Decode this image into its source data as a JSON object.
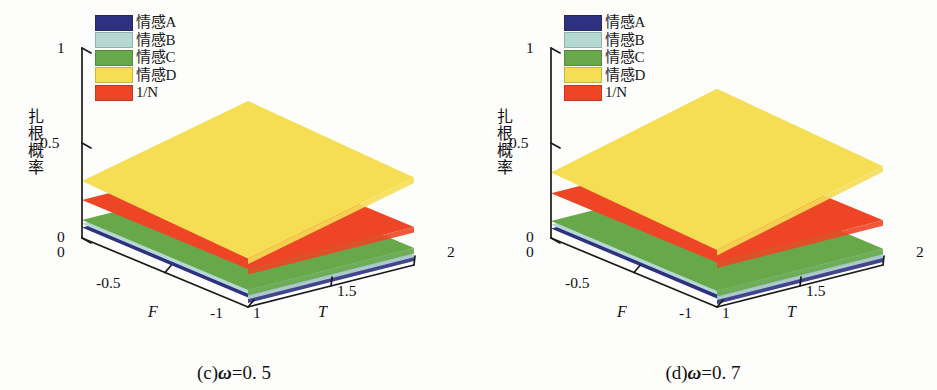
{
  "figure": {
    "panels": [
      {
        "id": "panel-c",
        "caption_prefix": "(c)",
        "caption_symbol": "ω",
        "caption_value": "=0. 5",
        "caption_full": "(c)ω=0. 5",
        "omega": 0.5
      },
      {
        "id": "panel-d",
        "caption_prefix": "(d)",
        "caption_symbol": "ω",
        "caption_value": "=0. 7",
        "caption_full": "(d)ω=0. 7",
        "omega": 0.7
      }
    ],
    "legend": {
      "items": [
        {
          "label": "情感A",
          "color": "#2e3080",
          "key": "emotion-a"
        },
        {
          "label": "情感B",
          "color": "#b6d8d2",
          "key": "emotion-b"
        },
        {
          "label": "情感C",
          "color": "#67a84b",
          "key": "emotion-c"
        },
        {
          "label": "情感D",
          "color": "#f5de54",
          "key": "emotion-d"
        },
        {
          "label": "1/N",
          "color": "#ee4526",
          "key": "one-over-n"
        }
      ]
    },
    "axes": {
      "z_label": "扎根概率",
      "z_ticks": [
        "0",
        "0.5",
        "1"
      ],
      "x_name": "T",
      "x_ticks": [
        "1",
        "1.5",
        "2"
      ],
      "y_name": "F",
      "y_ticks": [
        "0",
        "-0.5",
        "-1"
      ],
      "origin_tick": "0"
    }
  },
  "chart_data": [
    {
      "type": "surface",
      "title": "(c)ω=0. 5",
      "xlabel": "T",
      "ylabel": "F",
      "zlabel": "扎根概率",
      "xlim": [
        1,
        2
      ],
      "ylim": [
        -1,
        0
      ],
      "zlim": [
        0,
        1
      ],
      "grid": false,
      "legend_position": "upper-left",
      "series": [
        {
          "name": "情感A",
          "color": "#2e3080",
          "corners": {
            "T1_F0": 0.055,
            "T2_F0": 0.055,
            "T1_Fm1": 0.05,
            "T2_Fm1": 0.05
          }
        },
        {
          "name": "情感B",
          "color": "#b6d8d2",
          "corners": {
            "T1_F0": 0.075,
            "T2_F0": 0.075,
            "T1_Fm1": 0.07,
            "T2_Fm1": 0.07
          }
        },
        {
          "name": "情感C",
          "color": "#67a84b",
          "corners": {
            "T1_F0": 0.095,
            "T2_F0": 0.095,
            "T1_Fm1": 0.09,
            "T2_Fm1": 0.09
          }
        },
        {
          "name": "情感D",
          "color": "#f5de54",
          "corners": {
            "T1_F0": 0.3,
            "T2_F0": 0.5,
            "T1_Fm1": 0.255,
            "T2_Fm1": 0.46
          }
        },
        {
          "name": "1/N",
          "color": "#ee4526",
          "corners": {
            "T1_F0": 0.2,
            "T2_F0": 0.2,
            "T1_Fm1": 0.2,
            "T2_Fm1": 0.2
          }
        }
      ]
    },
    {
      "type": "surface",
      "title": "(d)ω=0. 7",
      "xlabel": "T",
      "ylabel": "F",
      "zlabel": "扎根概率",
      "xlim": [
        1,
        2
      ],
      "ylim": [
        -1,
        0
      ],
      "zlim": [
        0,
        1
      ],
      "grid": false,
      "legend_position": "upper-left",
      "series": [
        {
          "name": "情感A",
          "color": "#2e3080",
          "corners": {
            "T1_F0": 0.05,
            "T2_F0": 0.05,
            "T1_Fm1": 0.045,
            "T2_Fm1": 0.045
          }
        },
        {
          "name": "情感B",
          "color": "#b6d8d2",
          "corners": {
            "T1_F0": 0.07,
            "T2_F0": 0.07,
            "T1_Fm1": 0.065,
            "T2_Fm1": 0.065
          }
        },
        {
          "name": "情感C",
          "color": "#67a84b",
          "corners": {
            "T1_F0": 0.09,
            "T2_F0": 0.09,
            "T1_Fm1": 0.085,
            "T2_Fm1": 0.085
          }
        },
        {
          "name": "情感D",
          "color": "#f5de54",
          "corners": {
            "T1_F0": 0.345,
            "T2_F0": 0.565,
            "T1_Fm1": 0.3,
            "T2_Fm1": 0.52
          }
        },
        {
          "name": "1/N",
          "color": "#ee4526",
          "corners": {
            "T1_F0": 0.235,
            "T2_F0": 0.235,
            "T1_Fm1": 0.235,
            "T2_Fm1": 0.235
          }
        }
      ]
    }
  ]
}
